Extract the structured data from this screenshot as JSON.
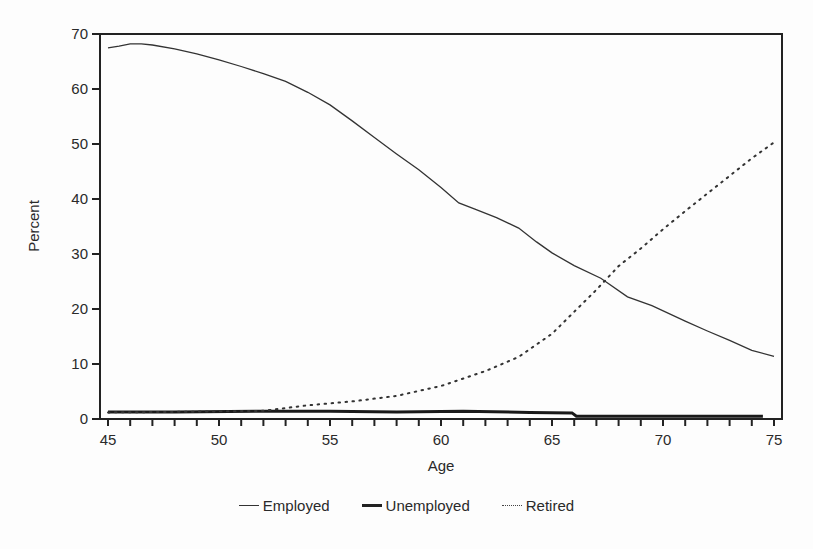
{
  "chart_data": {
    "type": "line",
    "title": "",
    "xlabel": "Age",
    "ylabel": "Percent",
    "xlim": [
      44.7,
      75.4
    ],
    "ylim": [
      0,
      70
    ],
    "x_ticks": [
      45,
      50,
      55,
      60,
      65,
      70,
      75
    ],
    "y_ticks": [
      0,
      10,
      20,
      30,
      40,
      50,
      60,
      70
    ],
    "grid": false,
    "legend_position": "bottom",
    "series": [
      {
        "name": "Employed",
        "style": "thin-solid",
        "x": [
          45,
          45.5,
          46,
          46.5,
          47,
          48,
          49,
          50,
          51,
          52,
          53,
          54,
          55,
          56,
          57,
          58,
          59,
          60,
          60.8,
          61.5,
          62.5,
          63.5,
          64.3,
          65,
          66,
          67.2,
          68.4,
          69.5,
          71,
          72,
          73,
          74,
          75
        ],
        "values": [
          67.5,
          67.8,
          68.2,
          68.2,
          68.0,
          67.3,
          66.4,
          65.3,
          64.1,
          62.8,
          61.4,
          59.4,
          57.1,
          54.2,
          51.2,
          48.2,
          45.3,
          42.1,
          39.3,
          38.2,
          36.6,
          34.7,
          32.2,
          30.2,
          27.9,
          25.6,
          22.2,
          20.6,
          17.8,
          16.0,
          14.3,
          12.5,
          11.4
        ]
      },
      {
        "name": "Unemployed",
        "style": "thick-solid",
        "x": [
          45,
          48,
          52,
          55,
          58,
          61,
          64,
          65.9,
          66.1,
          70,
          74.5
        ],
        "values": [
          1.3,
          1.3,
          1.4,
          1.4,
          1.3,
          1.4,
          1.2,
          1.1,
          0.5,
          0.5,
          0.5
        ]
      },
      {
        "name": "Retired",
        "style": "dotted",
        "x": [
          45,
          48,
          52,
          54,
          56,
          58,
          60,
          62,
          63.5,
          65,
          66,
          67,
          68,
          69,
          70,
          71,
          72,
          73,
          74,
          75
        ],
        "values": [
          1.2,
          1.3,
          1.5,
          2.5,
          3.2,
          4.2,
          6.0,
          8.7,
          11.3,
          15.5,
          19.5,
          23.5,
          27.8,
          31.0,
          34.5,
          37.8,
          41.0,
          44.2,
          47.4,
          50.3
        ]
      }
    ]
  },
  "legend": {
    "items": [
      {
        "label": "Employed"
      },
      {
        "label": "Unemployed"
      },
      {
        "label": "Retired"
      }
    ]
  }
}
